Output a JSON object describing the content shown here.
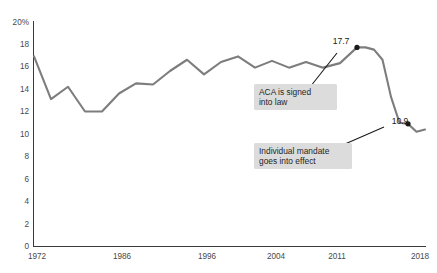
{
  "chart_data": {
    "type": "line",
    "title": "",
    "subtitle": "",
    "xlabel": "",
    "ylabel": "",
    "xlim": [
      1972,
      2018
    ],
    "ylim": [
      0,
      20
    ],
    "grid": false,
    "legend_position": "none",
    "y_ticks": [
      0,
      2,
      4,
      6,
      8,
      10,
      12,
      14,
      16,
      18,
      20
    ],
    "y_tick_labels": [
      "0",
      "2",
      "4",
      "6",
      "8",
      "10",
      "12",
      "14",
      "16",
      "18",
      "20%"
    ],
    "x_ticks": [
      1972,
      1986,
      1996,
      2004,
      2011,
      2018
    ],
    "x_tick_labels": [
      "1972",
      "1986",
      "1996",
      "2004",
      "2011",
      "2018"
    ],
    "series": [
      {
        "name": "Uninsured rate",
        "color": "#7d7d7d",
        "x": [
          1972,
          1974,
          1976,
          1978,
          1980,
          1982,
          1984,
          1986,
          1988,
          1990,
          1992,
          1994,
          1996,
          1998,
          2000,
          2002,
          2004,
          2006,
          2008,
          2010,
          2011,
          2012,
          2013,
          2014,
          2015,
          2016,
          2017,
          2018
        ],
        "values": [
          16.9,
          13.1,
          14.2,
          12.0,
          12.0,
          13.6,
          14.5,
          14.4,
          15.6,
          16.6,
          15.3,
          16.4,
          16.9,
          15.9,
          16.5,
          15.9,
          16.4,
          15.9,
          16.3,
          17.7,
          17.7,
          17.5,
          16.6,
          13.3,
          11.0,
          10.9,
          10.2,
          10.4
        ]
      }
    ],
    "annotated_points": [
      {
        "label": "17.7",
        "x": 2010,
        "y": 17.7
      },
      {
        "label": "10.9",
        "x": 2016,
        "y": 10.9
      }
    ],
    "annotations": [
      {
        "id": "aca-signed",
        "lines": [
          "ACA is signed",
          "into law"
        ],
        "box_color": "#dcdcdc"
      },
      {
        "id": "individual-mandate",
        "lines": [
          "Individual mandate",
          "goes into effect"
        ],
        "box_color": "#dcdcdc"
      }
    ]
  },
  "colors": {
    "line": "#7d7d7d",
    "axis": "#3a3a3a",
    "tick_text": "#4a4a4a",
    "annotation_box": "#dcdcdc",
    "annotation_text": "#1f1f1f",
    "background": "#ffffff"
  }
}
